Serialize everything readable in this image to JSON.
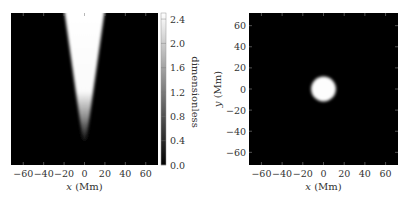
{
  "chart_data": [
    {
      "type": "heatmap",
      "panel": "left",
      "title": "",
      "xlabel_var": "x",
      "xlabel_unit": "(Mm)",
      "ylabel": "",
      "xlim": [
        -72,
        72
      ],
      "ylim": [
        0,
        1
      ],
      "xticks": [
        -60,
        -40,
        -20,
        0,
        20,
        40,
        60
      ],
      "xtick_labels": [
        "−60",
        "−40",
        "−20",
        "0",
        "20",
        "40",
        "60"
      ],
      "feature": {
        "shape": "cone",
        "description": "bright wedge, apex near bottom center, opening upward",
        "top_half_width": 20,
        "apex_fraction_from_bottom": 0.15,
        "center_x": 0
      },
      "colorbar": {
        "label": "dimensionless",
        "range": [
          0.0,
          2.5
        ],
        "ticks": [
          0.0,
          0.4,
          0.8,
          1.2,
          1.6,
          2.0,
          2.4
        ],
        "tick_labels": [
          "0.0",
          "0.4",
          "0.8",
          "1.2",
          "1.6",
          "2.0",
          "2.4"
        ],
        "colormap": "gray"
      }
    },
    {
      "type": "heatmap",
      "panel": "right",
      "title": "",
      "xlabel_var": "x",
      "xlabel_unit": "(Mm)",
      "ylabel_var": "y",
      "ylabel_unit": "(Mm)",
      "xlim": [
        -72,
        72
      ],
      "ylim": [
        -72,
        72
      ],
      "xticks": [
        -60,
        -40,
        -20,
        0,
        20,
        40,
        60
      ],
      "xtick_labels": [
        "−60",
        "−40",
        "−20",
        "0",
        "20",
        "40",
        "60"
      ],
      "yticks": [
        -60,
        -40,
        -20,
        0,
        20,
        40,
        60
      ],
      "ytick_labels": [
        "−60",
        "−40",
        "−20",
        "0",
        "20",
        "40",
        "60"
      ],
      "feature": {
        "shape": "disk",
        "center": [
          0,
          0
        ],
        "radius": 12
      },
      "colormap": "gray"
    }
  ]
}
